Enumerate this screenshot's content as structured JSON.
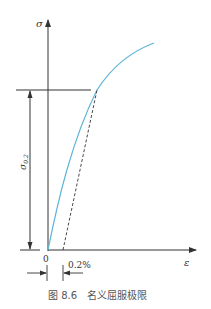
{
  "figure": {
    "caption": "图 8.6   名义屈服极限",
    "y_axis_label": "σ",
    "x_axis_label": "ε",
    "origin_label": "0",
    "offset_label": "0.2%",
    "yield_label": "σ",
    "yield_label_sub": "0.2",
    "colors": {
      "curve": "#5fb4d8",
      "axes": "#333333",
      "dashed": "#333333"
    }
  }
}
